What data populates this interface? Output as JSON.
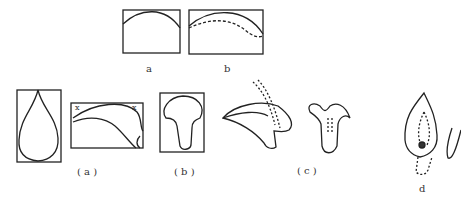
{
  "figure": {
    "labels": {
      "a_top": "a",
      "b_top": "b",
      "a_paren": "( a )",
      "b_paren": "( b )",
      "c_paren": "( c )",
      "d": "d"
    },
    "markers": {
      "cross_left": "x",
      "cross_right": "x"
    },
    "stroke_color": "#222222"
  }
}
